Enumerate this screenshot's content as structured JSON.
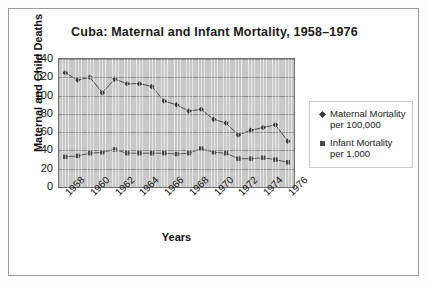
{
  "chart_data": {
    "type": "line",
    "title": "Cuba: Maternal and Infant Mortality, 1958–1976",
    "xlabel": "Years",
    "ylabel": "Maternal and Child Deaths",
    "ylim": [
      0,
      140
    ],
    "ytick_step": 20,
    "yticks": [
      140,
      120,
      100,
      80,
      60,
      40,
      20,
      0
    ],
    "grid": true,
    "legend_position": "right",
    "x": [
      1958,
      1959,
      1960,
      1961,
      1962,
      1963,
      1964,
      1965,
      1966,
      1967,
      1968,
      1969,
      1970,
      1971,
      1972,
      1973,
      1974,
      1975,
      1976
    ],
    "xtick_labels": [
      "1958",
      "1960",
      "1962",
      "1964",
      "1966",
      "1968",
      "1970",
      "1972",
      "1974",
      "1976"
    ],
    "series": [
      {
        "name": "Maternal Mortality per 100,000",
        "marker": "diamond",
        "color": "#3a3a3a",
        "values": [
          125,
          117,
          120,
          103,
          118,
          113,
          113,
          110,
          94,
          90,
          83,
          85,
          74,
          70,
          57,
          62,
          65,
          68,
          50
        ]
      },
      {
        "name": "Infant Mortality per 1,000",
        "marker": "square",
        "color": "#4a4a4a",
        "values": [
          33,
          34,
          37,
          38,
          41,
          37,
          37,
          37,
          37,
          36,
          37,
          42,
          38,
          37,
          31,
          31,
          32,
          30,
          27
        ]
      }
    ]
  },
  "legend": {
    "items": [
      {
        "label": "Maternal Mortality per 100,000",
        "marker": "diamond"
      },
      {
        "label": "Infant Mortality per 1,000",
        "marker": "square"
      }
    ]
  },
  "colors": {
    "plot_background": "#c8c8c8",
    "gridline": "#8d8d8d",
    "frame_border": "#9a9a9a",
    "text": "#111111"
  }
}
